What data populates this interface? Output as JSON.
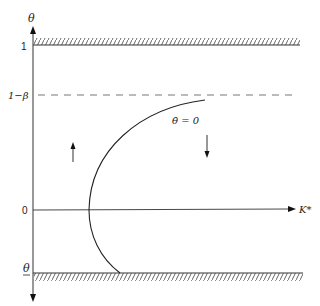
{
  "diagram": {
    "type": "phase-diagram",
    "y_axis": {
      "label": "θ"
    },
    "x_axis": {
      "label": "K*"
    },
    "y_ticks": [
      {
        "label": "1",
        "kind": "upper-bound-hatched"
      },
      {
        "label": "1−β",
        "kind": "dashed-asymptote"
      },
      {
        "label": "0",
        "kind": "x-axis"
      },
      {
        "label": "θ",
        "underline": true,
        "kind": "lower-bound-hatched"
      }
    ],
    "curve_label": "θ̇ = 0",
    "arrows": [
      {
        "direction": "up",
        "region": "left-of-curve"
      },
      {
        "direction": "down",
        "region": "right-of-curve"
      }
    ],
    "colors": {
      "ink": "#222222",
      "hatch": "#555555",
      "dash": "#666666"
    }
  }
}
